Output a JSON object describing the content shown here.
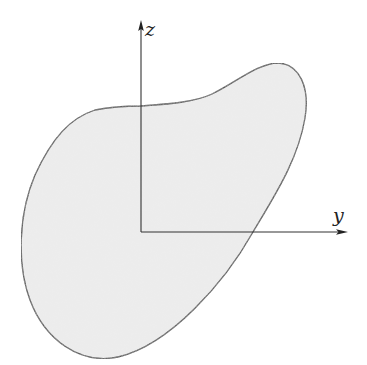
{
  "figure": {
    "type": "cross-section-with-axes",
    "shape": {
      "name": "arbitrary cross-section",
      "fill": "#ececec",
      "stroke": "#3a3a3a"
    },
    "axes": {
      "color": "#333333",
      "origin": [
        141,
        232
      ],
      "vertical": {
        "label": "z"
      },
      "horizontal": {
        "label": "y"
      }
    }
  }
}
